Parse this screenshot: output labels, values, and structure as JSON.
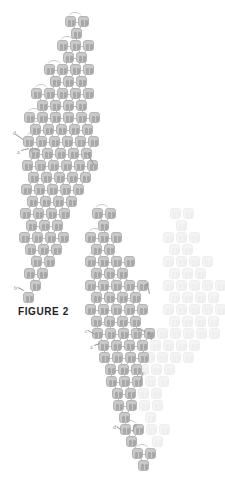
{
  "figure": {
    "caption": "FIGURE 2",
    "caption_position": {
      "x": 18,
      "y": 306
    },
    "canvas": {
      "width": 225,
      "height": 493
    },
    "background_color": "#ffffff",
    "cell_color": "#c9c9c9",
    "cell_border_color": "#b4b4b4",
    "cell_glyph_color": "#a8a8a8",
    "ghost_cell_color": "#f4f4f4",
    "connector_color": "#bdbdbd",
    "annotation_color": "#8d8d8d",
    "cell_size": 11,
    "cell_pitch_x": 13,
    "cell_pitch_y": 12
  },
  "chart_data": {
    "type": "diagram",
    "title": "FIGURE 2",
    "clusters": [
      {
        "name": "upper-left-array",
        "style": "solid",
        "rows": [
          {
            "y": 16,
            "xs": [
              65,
              78
            ]
          },
          {
            "y": 28,
            "xs": [
              71
            ]
          },
          {
            "y": 40,
            "xs": [
              57,
              70,
              83
            ]
          },
          {
            "y": 52,
            "xs": [
              63,
              76
            ]
          },
          {
            "y": 64,
            "xs": [
              44,
              57,
              70,
              83
            ]
          },
          {
            "y": 76,
            "xs": [
              50,
              63,
              76
            ]
          },
          {
            "y": 88,
            "xs": [
              31,
              44,
              57,
              70,
              83
            ]
          },
          {
            "y": 100,
            "xs": [
              37,
              50,
              63,
              76
            ]
          },
          {
            "y": 112,
            "xs": [
              24,
              37,
              50,
              63,
              76,
              89
            ]
          },
          {
            "y": 124,
            "xs": [
              30,
              43,
              56,
              69,
              82
            ]
          },
          {
            "y": 136,
            "xs": [
              23,
              36,
              49,
              62,
              75,
              88
            ]
          },
          {
            "y": 148,
            "xs": [
              29,
              42,
              55,
              68,
              81
            ]
          },
          {
            "y": 160,
            "xs": [
              22,
              35,
              48,
              61,
              74,
              87
            ]
          },
          {
            "y": 172,
            "xs": [
              28,
              41,
              54,
              67,
              80
            ]
          },
          {
            "y": 184,
            "xs": [
              21,
              34,
              47,
              60,
              73
            ]
          },
          {
            "y": 196,
            "xs": [
              27,
              40,
              53,
              66
            ]
          },
          {
            "y": 208,
            "xs": [
              20,
              33,
              46,
              59
            ]
          },
          {
            "y": 220,
            "xs": [
              26,
              39,
              52
            ]
          },
          {
            "y": 232,
            "xs": [
              19,
              32,
              45,
              58
            ]
          },
          {
            "y": 244,
            "xs": [
              25,
              38,
              51
            ]
          },
          {
            "y": 256,
            "xs": [
              31,
              44
            ]
          },
          {
            "y": 268,
            "xs": [
              24,
              37
            ]
          },
          {
            "y": 280,
            "xs": [
              30
            ]
          },
          {
            "y": 292,
            "xs": [
              23
            ]
          }
        ]
      },
      {
        "name": "lower-right-array",
        "style": "solid",
        "rows": [
          {
            "y": 208,
            "xs": [
              92,
              105
            ]
          },
          {
            "y": 220,
            "xs": [
              98
            ]
          },
          {
            "y": 232,
            "xs": [
              85,
              98,
              111
            ]
          },
          {
            "y": 244,
            "xs": [
              91,
              104
            ]
          },
          {
            "y": 256,
            "xs": [
              85,
              98,
              111,
              124
            ]
          },
          {
            "y": 268,
            "xs": [
              91,
              104,
              117
            ]
          },
          {
            "y": 280,
            "xs": [
              85,
              98,
              111,
              124,
              137
            ]
          },
          {
            "y": 292,
            "xs": [
              91,
              104,
              117,
              130
            ]
          },
          {
            "y": 304,
            "xs": [
              85,
              98,
              111,
              124,
              137
            ]
          },
          {
            "y": 316,
            "xs": [
              91,
              104,
              117,
              130
            ]
          },
          {
            "y": 328,
            "xs": [
              92,
              105,
              118,
              131,
              144
            ]
          },
          {
            "y": 340,
            "xs": [
              98,
              111,
              124,
              137
            ]
          },
          {
            "y": 352,
            "xs": [
              99,
              112,
              125,
              138
            ]
          },
          {
            "y": 364,
            "xs": [
              105,
              118,
              131
            ]
          },
          {
            "y": 376,
            "xs": [
              106,
              119,
              132
            ]
          },
          {
            "y": 388,
            "xs": [
              112,
              125
            ]
          },
          {
            "y": 400,
            "xs": [
              113,
              126
            ]
          },
          {
            "y": 412,
            "xs": [
              119
            ]
          },
          {
            "y": 424,
            "xs": [
              120,
              133
            ]
          },
          {
            "y": 436,
            "xs": [
              126
            ]
          },
          {
            "y": 448,
            "xs": [
              132,
              145
            ]
          },
          {
            "y": 460,
            "xs": [
              138
            ]
          }
        ]
      },
      {
        "name": "ghost-duplicate-array",
        "style": "ghost",
        "rows": [
          {
            "y": 208,
            "xs": [
              170,
              183
            ]
          },
          {
            "y": 220,
            "xs": [
              176
            ]
          },
          {
            "y": 232,
            "xs": [
              163,
              176,
              189
            ]
          },
          {
            "y": 244,
            "xs": [
              169,
              182
            ]
          },
          {
            "y": 256,
            "xs": [
              163,
              176,
              189,
              202
            ]
          },
          {
            "y": 268,
            "xs": [
              169,
              182,
              195
            ]
          },
          {
            "y": 280,
            "xs": [
              163,
              176,
              189,
              202,
              215
            ]
          },
          {
            "y": 292,
            "xs": [
              169,
              182,
              195,
              208
            ]
          },
          {
            "y": 304,
            "xs": [
              163,
              176,
              189,
              202,
              215
            ]
          },
          {
            "y": 316,
            "xs": [
              169,
              182,
              195,
              208
            ]
          },
          {
            "y": 328,
            "xs": [
              157,
              170,
              183,
              196,
              209
            ]
          },
          {
            "y": 340,
            "xs": [
              150,
              163,
              176,
              189
            ]
          },
          {
            "y": 352,
            "xs": [
              144,
              157,
              170,
              183
            ]
          },
          {
            "y": 364,
            "xs": [
              138,
              151,
              164
            ]
          },
          {
            "y": 376,
            "xs": [
              132,
              145,
              158
            ]
          },
          {
            "y": 388,
            "xs": [
              138,
              151
            ]
          },
          {
            "y": 400,
            "xs": [
              139,
              152
            ]
          },
          {
            "y": 412,
            "xs": [
              145
            ]
          },
          {
            "y": 424,
            "xs": [
              146,
              159
            ]
          },
          {
            "y": 436,
            "xs": [
              152
            ]
          }
        ]
      }
    ],
    "arcs": [
      {
        "x": 68,
        "y": 12,
        "w": 14
      },
      {
        "x": 60,
        "y": 36,
        "w": 14
      },
      {
        "x": 47,
        "y": 60,
        "w": 14
      },
      {
        "x": 34,
        "y": 84,
        "w": 14
      },
      {
        "x": 27,
        "y": 108,
        "w": 14
      },
      {
        "x": 33,
        "y": 120,
        "w": 14
      },
      {
        "x": 26,
        "y": 132,
        "w": 14
      },
      {
        "x": 95,
        "y": 204,
        "w": 14
      },
      {
        "x": 88,
        "y": 228,
        "w": 14
      },
      {
        "x": 88,
        "y": 252,
        "w": 14
      },
      {
        "x": 114,
        "y": 276,
        "w": 14
      },
      {
        "x": 120,
        "y": 300,
        "w": 14
      },
      {
        "x": 95,
        "y": 324,
        "w": 14
      },
      {
        "x": 123,
        "y": 420,
        "w": 14
      },
      {
        "x": 135,
        "y": 444,
        "w": 14
      }
    ],
    "annotations": [
      {
        "label": "d",
        "x": 13,
        "y": 130,
        "lead": {
          "x1": 16,
          "y1": 134,
          "x2": 23,
          "y2": 139
        }
      },
      {
        "label": "a",
        "x": 17,
        "y": 149,
        "lead": {
          "x1": 21,
          "y1": 150,
          "x2": 29,
          "y2": 148
        }
      },
      {
        "label": "b",
        "x": 30,
        "y": 147,
        "lead": {
          "x1": 33,
          "y1": 148,
          "x2": 40,
          "y2": 150
        }
      },
      {
        "label": "c",
        "x": 88,
        "y": 150,
        "lead": {
          "x1": 88,
          "y1": 153,
          "x2": 94,
          "y2": 164
        }
      },
      {
        "label": "b",
        "x": 14,
        "y": 285,
        "lead": {
          "x1": 18,
          "y1": 287,
          "x2": 24,
          "y2": 290
        }
      },
      {
        "label": "d",
        "x": 146,
        "y": 281,
        "lead": {
          "x1": 148,
          "y1": 284,
          "x2": 150,
          "y2": 294
        }
      },
      {
        "label": "c",
        "x": 85,
        "y": 328,
        "lead": {
          "x1": 88,
          "y1": 330,
          "x2": 95,
          "y2": 334
        }
      },
      {
        "label": "a",
        "x": 90,
        "y": 344,
        "lead": {
          "x1": 94,
          "y1": 345,
          "x2": 100,
          "y2": 343
        }
      },
      {
        "label": "a",
        "x": 137,
        "y": 326,
        "lead": {
          "x1": 140,
          "y1": 328,
          "x2": 146,
          "y2": 332
        }
      },
      {
        "label": "b",
        "x": 148,
        "y": 330,
        "lead": {
          "x1": 150,
          "y1": 333,
          "x2": 152,
          "y2": 340
        }
      },
      {
        "label": "c",
        "x": 142,
        "y": 370,
        "lead": {
          "x1": 143,
          "y1": 373,
          "x2": 141,
          "y2": 382
        }
      },
      {
        "label": "d",
        "x": 113,
        "y": 424,
        "lead": {
          "x1": 117,
          "y1": 426,
          "x2": 122,
          "y2": 430
        }
      },
      {
        "label": "a",
        "x": 134,
        "y": 422,
        "lead": {
          "x1": 135,
          "y1": 425,
          "x2": 133,
          "y2": 432
        }
      }
    ]
  }
}
